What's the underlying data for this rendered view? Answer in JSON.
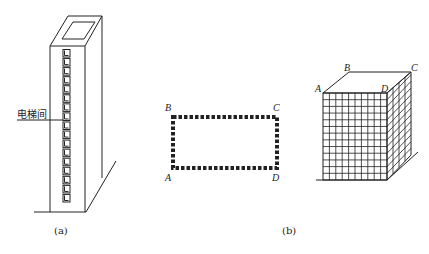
{
  "figure_a": {
    "caption": "(a)",
    "label": "电梯间",
    "elevator_boxes": 17
  },
  "figure_b": {
    "caption": "(b)",
    "rectangle_corners": {
      "top_left": "B",
      "top_right": "C",
      "bottom_left": "A",
      "bottom_right": "D"
    },
    "box_corners": {
      "front_top_left": "A",
      "back_top_left": "B",
      "back_top_right": "C",
      "front_top_right": "D"
    },
    "grid_front_cols": 10,
    "grid_front_rows": 13,
    "grid_side_cols": 4
  },
  "colors": {
    "stroke": "#222222",
    "background": "#ffffff"
  }
}
